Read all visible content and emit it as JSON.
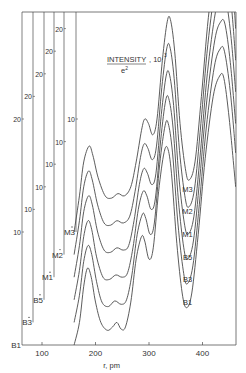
{
  "chart_data": {
    "type": "line",
    "title_parts": {
      "numerator": "INTENSITY",
      "denominator": "e2",
      "unit": ", 10",
      "unit_exp": "3"
    },
    "xlabel": "r, pm",
    "ylabel": "INTENSITY/e^2, 10^3",
    "x_ticks": [
      100,
      200,
      300,
      400
    ],
    "xlim": [
      100,
      462
    ],
    "y_ticks_per_axis": [
      10,
      20
    ],
    "layout": "stacked offset curves, each with its own offset y-axis",
    "grid": false,
    "series": [
      {
        "name": "B1",
        "offset": 0,
        "axis_x": 22,
        "baseline_label": "B1",
        "points": [
          [
            160,
            0
          ],
          [
            170,
            2.0
          ],
          [
            178,
            5.2
          ],
          [
            185,
            6.8
          ],
          [
            192,
            6.0
          ],
          [
            200,
            3.8
          ],
          [
            210,
            2.0
          ],
          [
            222,
            1.3
          ],
          [
            232,
            1.6
          ],
          [
            240,
            2.0
          ],
          [
            248,
            1.4
          ],
          [
            256,
            1.6
          ],
          [
            266,
            3.8
          ],
          [
            276,
            7.6
          ],
          [
            286,
            9.6
          ],
          [
            292,
            9.2
          ],
          [
            300,
            7.6
          ],
          [
            308,
            8.6
          ],
          [
            318,
            13.6
          ],
          [
            328,
            17.0
          ],
          [
            335,
            17.4
          ],
          [
            342,
            15.2
          ],
          [
            352,
            9.0
          ],
          [
            362,
            4.6
          ],
          [
            370,
            3.3
          ],
          [
            380,
            4.6
          ],
          [
            392,
            9.8
          ],
          [
            405,
            16.5
          ],
          [
            420,
            22.0
          ],
          [
            432,
            23.8
          ],
          [
            440,
            23.6
          ],
          [
            450,
            20.0
          ],
          [
            462,
            14.0
          ]
        ]
      },
      {
        "name": "B3",
        "offset": 2,
        "axis_x": 33,
        "baseline_label": "B3",
        "points": [
          [
            160,
            0
          ],
          [
            170,
            2.4
          ],
          [
            178,
            5.4
          ],
          [
            186,
            6.8
          ],
          [
            193,
            6.0
          ],
          [
            202,
            3.6
          ],
          [
            212,
            1.8
          ],
          [
            224,
            1.4
          ],
          [
            236,
            1.9
          ],
          [
            248,
            1.6
          ],
          [
            258,
            2.0
          ],
          [
            268,
            4.2
          ],
          [
            278,
            7.8
          ],
          [
            288,
            9.6
          ],
          [
            294,
            9.2
          ],
          [
            302,
            7.8
          ],
          [
            310,
            8.8
          ],
          [
            320,
            14.0
          ],
          [
            330,
            17.4
          ],
          [
            336,
            17.6
          ],
          [
            344,
            15.0
          ],
          [
            354,
            8.8
          ],
          [
            364,
            4.6
          ],
          [
            371,
            3.4
          ],
          [
            382,
            5.0
          ],
          [
            394,
            10.4
          ],
          [
            407,
            17.2
          ],
          [
            422,
            22.6
          ],
          [
            433,
            24.2
          ],
          [
            441,
            24.0
          ],
          [
            452,
            20.4
          ],
          [
            462,
            15.0
          ]
        ]
      },
      {
        "name": "B5",
        "offset": 4,
        "axis_x": 44,
        "baseline_label": "B5",
        "points": [
          [
            160,
            0
          ],
          [
            170,
            2.6
          ],
          [
            178,
            5.6
          ],
          [
            186,
            7.0
          ],
          [
            193,
            6.2
          ],
          [
            202,
            3.8
          ],
          [
            214,
            2.0
          ],
          [
            226,
            1.8
          ],
          [
            238,
            2.2
          ],
          [
            250,
            2.0
          ],
          [
            260,
            2.4
          ],
          [
            270,
            4.6
          ],
          [
            280,
            8.0
          ],
          [
            289,
            9.6
          ],
          [
            296,
            9.2
          ],
          [
            304,
            8.0
          ],
          [
            312,
            9.0
          ],
          [
            322,
            14.2
          ],
          [
            331,
            17.6
          ],
          [
            337,
            17.8
          ],
          [
            345,
            15.2
          ],
          [
            355,
            8.8
          ],
          [
            365,
            4.6
          ],
          [
            372,
            3.6
          ],
          [
            383,
            5.2
          ],
          [
            395,
            10.8
          ],
          [
            408,
            17.6
          ],
          [
            423,
            23.0
          ],
          [
            434,
            24.6
          ],
          [
            442,
            24.4
          ],
          [
            452,
            21.0
          ],
          [
            462,
            15.6
          ]
        ]
      },
      {
        "name": "M1",
        "offset": 6,
        "axis_x": 54,
        "baseline_label": "M1",
        "points": [
          [
            160,
            0
          ],
          [
            170,
            2.8
          ],
          [
            178,
            5.8
          ],
          [
            187,
            7.2
          ],
          [
            194,
            6.4
          ],
          [
            204,
            4.0
          ],
          [
            216,
            2.4
          ],
          [
            228,
            2.2
          ],
          [
            240,
            2.6
          ],
          [
            252,
            2.4
          ],
          [
            262,
            2.8
          ],
          [
            272,
            5.0
          ],
          [
            282,
            8.2
          ],
          [
            290,
            9.6
          ],
          [
            297,
            9.2
          ],
          [
            305,
            8.2
          ],
          [
            313,
            9.2
          ],
          [
            323,
            14.4
          ],
          [
            332,
            17.8
          ],
          [
            338,
            18.0
          ],
          [
            346,
            15.2
          ],
          [
            356,
            8.8
          ],
          [
            366,
            4.8
          ],
          [
            373,
            3.8
          ],
          [
            384,
            5.4
          ],
          [
            396,
            11.0
          ],
          [
            409,
            18.0
          ],
          [
            424,
            23.4
          ],
          [
            435,
            25.0
          ],
          [
            443,
            24.8
          ],
          [
            453,
            21.4
          ],
          [
            462,
            16.4
          ]
        ]
      },
      {
        "name": "M2",
        "offset": 8,
        "axis_x": 64,
        "baseline_label": "M2",
        "points": [
          [
            160,
            0
          ],
          [
            170,
            3.0
          ],
          [
            178,
            6.0
          ],
          [
            187,
            7.4
          ],
          [
            194,
            6.6
          ],
          [
            204,
            4.4
          ],
          [
            216,
            2.8
          ],
          [
            228,
            2.6
          ],
          [
            240,
            3.0
          ],
          [
            252,
            2.8
          ],
          [
            264,
            3.4
          ],
          [
            274,
            5.6
          ],
          [
            284,
            8.6
          ],
          [
            291,
            9.8
          ],
          [
            298,
            9.4
          ],
          [
            306,
            8.4
          ],
          [
            314,
            9.6
          ],
          [
            324,
            14.8
          ],
          [
            333,
            18.2
          ],
          [
            339,
            18.4
          ],
          [
            347,
            15.6
          ],
          [
            357,
            9.2
          ],
          [
            367,
            5.2
          ],
          [
            374,
            4.2
          ],
          [
            385,
            5.8
          ],
          [
            397,
            11.6
          ],
          [
            410,
            18.6
          ],
          [
            425,
            24.0
          ],
          [
            436,
            25.6
          ],
          [
            444,
            25.4
          ],
          [
            454,
            22.0
          ],
          [
            462,
            17.2
          ]
        ]
      },
      {
        "name": "M3",
        "offset": 10,
        "axis_x": 76,
        "baseline_label": "M3",
        "points": [
          [
            160,
            0
          ],
          [
            170,
            3.2
          ],
          [
            178,
            6.2
          ],
          [
            188,
            7.6
          ],
          [
            195,
            6.8
          ],
          [
            205,
            4.8
          ],
          [
            218,
            3.2
          ],
          [
            230,
            3.0
          ],
          [
            242,
            3.4
          ],
          [
            254,
            3.2
          ],
          [
            266,
            4.0
          ],
          [
            276,
            6.2
          ],
          [
            286,
            9.0
          ],
          [
            292,
            10.0
          ],
          [
            299,
            9.6
          ],
          [
            307,
            8.6
          ],
          [
            315,
            10.0
          ],
          [
            325,
            15.2
          ],
          [
            334,
            18.6
          ],
          [
            340,
            18.8
          ],
          [
            348,
            16.0
          ],
          [
            358,
            9.6
          ],
          [
            368,
            5.6
          ],
          [
            375,
            4.6
          ],
          [
            386,
            6.2
          ],
          [
            398,
            12.0
          ],
          [
            411,
            19.0
          ],
          [
            426,
            24.4
          ],
          [
            437,
            26.0
          ],
          [
            445,
            25.8
          ],
          [
            455,
            22.6
          ],
          [
            462,
            18.0
          ]
        ]
      }
    ]
  },
  "axes": {
    "x_tick_labels": [
      "100",
      "200",
      "300",
      "400"
    ],
    "x_label": "r, pm",
    "offset_axes": [
      {
        "name": "B1",
        "base_label": "B1",
        "tick_labels": [
          "10",
          "20"
        ]
      },
      {
        "name": "B3",
        "base_label": "B3*",
        "tick_labels": [
          "10",
          "20"
        ]
      },
      {
        "name": "B5",
        "base_label": "B5*",
        "tick_labels": [
          "10",
          "20"
        ]
      },
      {
        "name": "M1",
        "base_label": "M1*",
        "tick_labels": [
          "10",
          "20"
        ]
      },
      {
        "name": "M2",
        "base_label": "M2*",
        "tick_labels": [
          "10",
          "20"
        ]
      },
      {
        "name": "M3",
        "base_label": "M3*",
        "tick_labels": [
          "10"
        ]
      }
    ],
    "curve_labels": [
      "M3",
      "M2",
      "M1",
      "B5",
      "B3",
      "B1"
    ]
  },
  "style": {
    "line_color": "#4a4a4a",
    "text_color": "#333333",
    "background": "#ffffff"
  }
}
